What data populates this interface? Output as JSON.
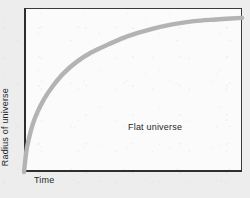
{
  "figure": {
    "background_color": "#ededed",
    "plot_background_color": "#fbfbfb",
    "frame_color": "#2e2e30"
  },
  "axes": {
    "x_label": "Time",
    "y_label": "Radius of universe"
  },
  "annotations": {
    "flat_universe": "Flat universe"
  },
  "chart_data": {
    "type": "line",
    "title": "",
    "xlabel": "Time",
    "ylabel": "Radius of universe",
    "xlim": [
      0,
      1
    ],
    "ylim": [
      0,
      1
    ],
    "grid": false,
    "legend": "none",
    "annotations": [
      {
        "text": "Flat universe",
        "x": 0.48,
        "y": 0.31
      }
    ],
    "series": [
      {
        "name": "Flat universe",
        "color": "#b3b3b3",
        "line_width": 4,
        "description": "Radius grows as t^(2/3); rises steeply from the origin then flattens toward an asymptote without ever recollapsing.",
        "x": [
          0.0,
          0.01,
          0.02,
          0.04,
          0.06,
          0.09,
          0.13,
          0.18,
          0.24,
          0.31,
          0.39,
          0.48,
          0.58,
          0.68,
          0.78,
          0.88,
          1.0
        ],
        "y": [
          0.0,
          0.12,
          0.19,
          0.29,
          0.36,
          0.44,
          0.52,
          0.6,
          0.67,
          0.73,
          0.78,
          0.83,
          0.87,
          0.9,
          0.92,
          0.93,
          0.94
        ]
      }
    ]
  }
}
